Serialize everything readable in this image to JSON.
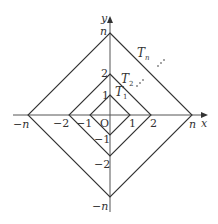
{
  "diagram": {
    "origin_label": "O",
    "axes": {
      "x_label": "x",
      "y_label": "y"
    },
    "x_ticks": [
      "−n",
      "−2",
      "−1",
      "1",
      "2",
      "n"
    ],
    "y_ticks": [
      "n",
      "2",
      "1",
      "−1",
      "−2",
      "−n"
    ],
    "squares": [
      {
        "name": "T1",
        "label_main": "T",
        "label_sub": "1",
        "half_diagonal": "1"
      },
      {
        "name": "T2",
        "label_main": "T",
        "label_sub": "2",
        "half_diagonal": "2"
      },
      {
        "name": "Tn",
        "label_main": "T",
        "label_sub": "n",
        "half_diagonal": "n"
      }
    ],
    "ellipsis": "⋰",
    "colors": {
      "line": "#333333",
      "axis": "#555555",
      "background": "#ffffff"
    }
  }
}
